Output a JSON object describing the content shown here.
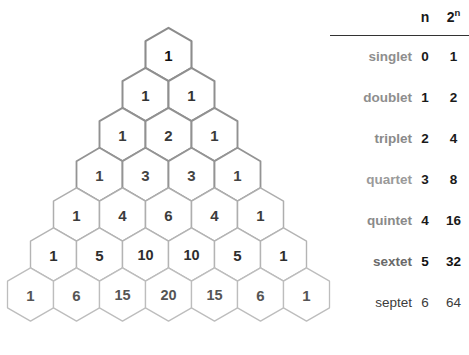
{
  "figure": {
    "background_color": "#ffffff"
  },
  "pyramid": {
    "name": "pascal-triangle-hex-pyramid",
    "rows": [
      {
        "index": 0,
        "values": [
          "1"
        ],
        "stroke_color": "#8c8c8c",
        "stroke_width": 2.1,
        "text_color": "#111111"
      },
      {
        "index": 1,
        "values": [
          "1",
          "1"
        ],
        "stroke_color": "#8f8f8f",
        "stroke_width": 2.0,
        "text_color": "#333333"
      },
      {
        "index": 2,
        "values": [
          "1",
          "2",
          "1"
        ],
        "stroke_color": "#919191",
        "stroke_width": 1.9,
        "text_color": "#3a3a3a"
      },
      {
        "index": 3,
        "values": [
          "1",
          "3",
          "3",
          "1"
        ],
        "stroke_color": "#949494",
        "stroke_width": 1.8,
        "text_color": "#444444"
      },
      {
        "index": 4,
        "values": [
          "1",
          "4",
          "6",
          "4",
          "1"
        ],
        "stroke_color": "#aeaeae",
        "stroke_width": 1.5,
        "text_color": "#3c3c3c"
      },
      {
        "index": 5,
        "values": [
          "1",
          "5",
          "10",
          "10",
          "5",
          "1"
        ],
        "stroke_color": "#b4b4b4",
        "stroke_width": 1.4,
        "text_color": "#2e2e2e"
      },
      {
        "index": 6,
        "values": [
          "1",
          "6",
          "15",
          "20",
          "15",
          "6",
          "1"
        ],
        "stroke_color": "#bdbdbd",
        "stroke_width": 1.3,
        "text_color": "#555555"
      }
    ]
  },
  "table": {
    "name": "multiplicity-table",
    "header": {
      "blank": "",
      "n_label": "n",
      "power_base": "2",
      "power_exponent": "n"
    },
    "rows": [
      {
        "name": "singlet",
        "n": "0",
        "power": "1",
        "name_color": "#8e8e8e",
        "value_color": "#1a1a1a",
        "bold": true
      },
      {
        "name": "doublet",
        "n": "1",
        "power": "2",
        "name_color": "#8e8e8e",
        "value_color": "#1a1a1a",
        "bold": true
      },
      {
        "name": "triplet",
        "n": "2",
        "power": "4",
        "name_color": "#8a8a8a",
        "value_color": "#1a1a1a",
        "bold": true
      },
      {
        "name": "quartet",
        "n": "3",
        "power": "8",
        "name_color": "#9a9a9a",
        "value_color": "#1a1a1a",
        "bold": true
      },
      {
        "name": "quintet",
        "n": "4",
        "power": "16",
        "name_color": "#8a8a8a",
        "value_color": "#1a1a1a",
        "bold": true
      },
      {
        "name": "sextet",
        "n": "5",
        "power": "32",
        "name_color": "#6a6a6a",
        "value_color": "#111111",
        "bold": true
      },
      {
        "name": "septet",
        "n": "6",
        "power": "64",
        "name_color": "#3c3c3c",
        "value_color": "#3c3c3c",
        "bold": false
      }
    ],
    "rule_color": "#333333"
  }
}
